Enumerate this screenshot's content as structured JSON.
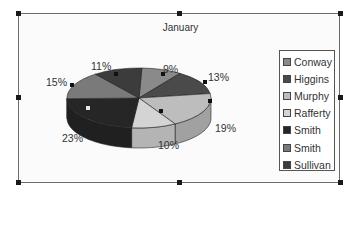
{
  "chart_data": {
    "type": "pie",
    "style": "3d-pie",
    "title": "January",
    "categories": [
      "Conway",
      "Higgins",
      "Murphy",
      "Rafferty",
      "Smith",
      "Smith",
      "Sullivan"
    ],
    "values": [
      9,
      13,
      19,
      10,
      23,
      15,
      11
    ],
    "value_labels": [
      "9%",
      "13%",
      "19%",
      "10%",
      "23%",
      "15%",
      "11%"
    ],
    "colors": [
      "#8a8a8a",
      "#4a4a4a",
      "#bdbdbd",
      "#d4d4d4",
      "#262626",
      "#7a7a7a",
      "#3c3c3c"
    ],
    "legend_position": "right",
    "unit": "percent"
  },
  "chart": {
    "title": "January",
    "legend": [
      {
        "label": "Conway",
        "color": "#8a8a8a"
      },
      {
        "label": "Higgins",
        "color": "#4a4a4a"
      },
      {
        "label": "Murphy",
        "color": "#bdbdbd"
      },
      {
        "label": "Rafferty",
        "color": "#d4d4d4"
      },
      {
        "label": "Smith",
        "color": "#262626"
      },
      {
        "label": "Smith",
        "color": "#7a7a7a"
      },
      {
        "label": "Sullivan",
        "color": "#3c3c3c"
      }
    ],
    "labels": [
      "9%",
      "13%",
      "19%",
      "10%",
      "23%",
      "15%",
      "11%"
    ]
  }
}
